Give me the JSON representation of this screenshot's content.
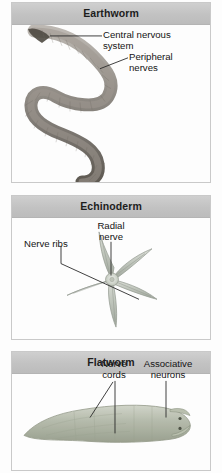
{
  "figure": {
    "name": "nervous-system-comparison",
    "background": "#fdfdfd",
    "header_bg": "#c4c4c4",
    "text_color": "#141414"
  },
  "panels": [
    {
      "id": "earthworm",
      "title": "Earthworm",
      "organism_icon": "earthworm-illustration",
      "labels": [
        {
          "id": "central-nervous-system",
          "text": "Central nervous\nsystem"
        },
        {
          "id": "peripheral-nerves",
          "text": "Peripheral\nnerves"
        }
      ]
    },
    {
      "id": "echinoderm",
      "title": "Echinoderm",
      "organism_icon": "sea-star-illustration",
      "labels": [
        {
          "id": "radial-nerve",
          "text": "Radial\nnerve"
        },
        {
          "id": "nerve-ribs",
          "text": "Nerve ribs"
        }
      ]
    },
    {
      "id": "flatworm",
      "title": "Flatworm",
      "organism_icon": "flatworm-illustration",
      "labels": [
        {
          "id": "nerve-cords",
          "text": "Nerve\ncords"
        },
        {
          "id": "associative-neurons",
          "text": "Associative\nneurons"
        }
      ]
    }
  ]
}
